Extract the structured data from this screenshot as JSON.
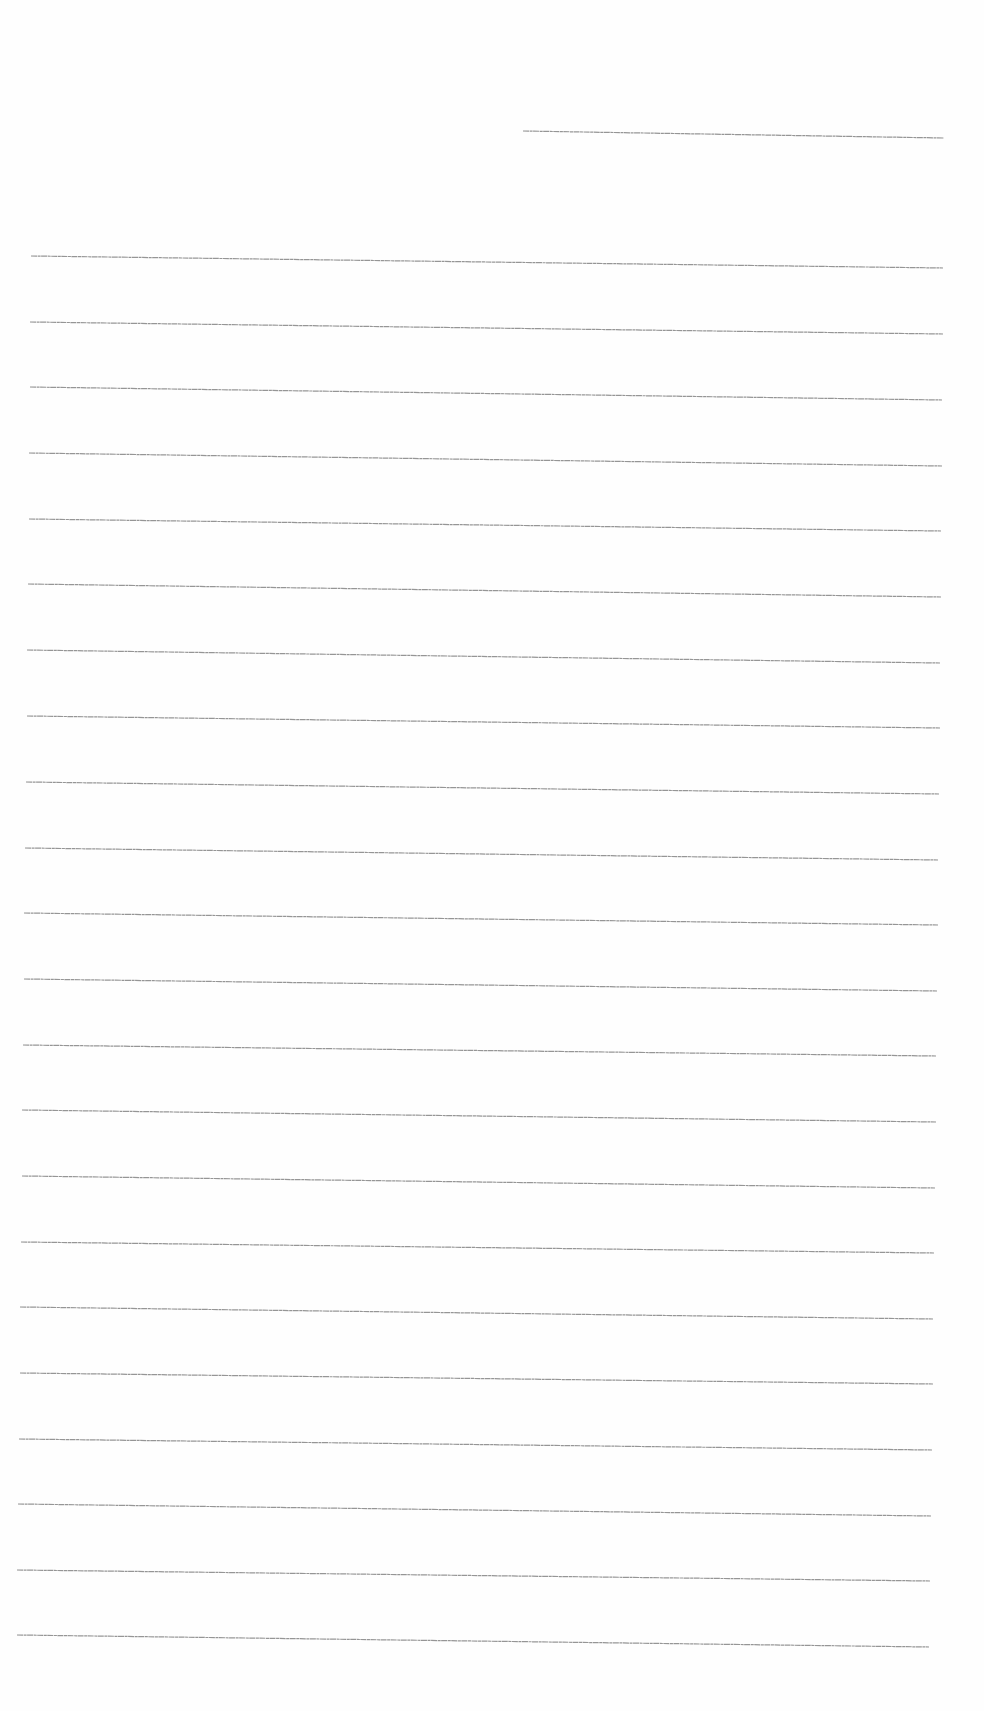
{
  "document": {
    "type": "ruled-writing-sheet",
    "background_color": "#fefefe",
    "line_color": "#8a8a8a",
    "header_line": {
      "x1": 523,
      "y1": 131,
      "x2": 944,
      "y2": 138
    },
    "ruled_lines": [
      {
        "x1": 31,
        "y1": 256,
        "x2": 943,
        "y2": 268
      },
      {
        "x1": 30,
        "y1": 322,
        "x2": 943,
        "y2": 334
      },
      {
        "x1": 30,
        "y1": 387,
        "x2": 942,
        "y2": 400
      },
      {
        "x1": 29,
        "y1": 453,
        "x2": 942,
        "y2": 466
      },
      {
        "x1": 29,
        "y1": 519,
        "x2": 941,
        "y2": 531
      },
      {
        "x1": 28,
        "y1": 584,
        "x2": 941,
        "y2": 597
      },
      {
        "x1": 27,
        "y1": 650,
        "x2": 940,
        "y2": 663
      },
      {
        "x1": 27,
        "y1": 716,
        "x2": 940,
        "y2": 728
      },
      {
        "x1": 26,
        "y1": 782,
        "x2": 939,
        "y2": 794
      },
      {
        "x1": 25,
        "y1": 848,
        "x2": 938,
        "y2": 860
      },
      {
        "x1": 24,
        "y1": 913,
        "x2": 938,
        "y2": 925
      },
      {
        "x1": 24,
        "y1": 979,
        "x2": 937,
        "y2": 991
      },
      {
        "x1": 23,
        "y1": 1045,
        "x2": 936,
        "y2": 1056
      },
      {
        "x1": 22,
        "y1": 1110,
        "x2": 936,
        "y2": 1122
      },
      {
        "x1": 22,
        "y1": 1176,
        "x2": 935,
        "y2": 1188
      },
      {
        "x1": 21,
        "y1": 1242,
        "x2": 934,
        "y2": 1253
      },
      {
        "x1": 20,
        "y1": 1307,
        "x2": 933,
        "y2": 1319
      },
      {
        "x1": 20,
        "y1": 1373,
        "x2": 933,
        "y2": 1384
      },
      {
        "x1": 19,
        "y1": 1439,
        "x2": 932,
        "y2": 1450
      },
      {
        "x1": 18,
        "y1": 1504,
        "x2": 931,
        "y2": 1516
      },
      {
        "x1": 17,
        "y1": 1570,
        "x2": 930,
        "y2": 1581
      },
      {
        "x1": 17,
        "y1": 1635,
        "x2": 929,
        "y2": 1647
      }
    ]
  }
}
